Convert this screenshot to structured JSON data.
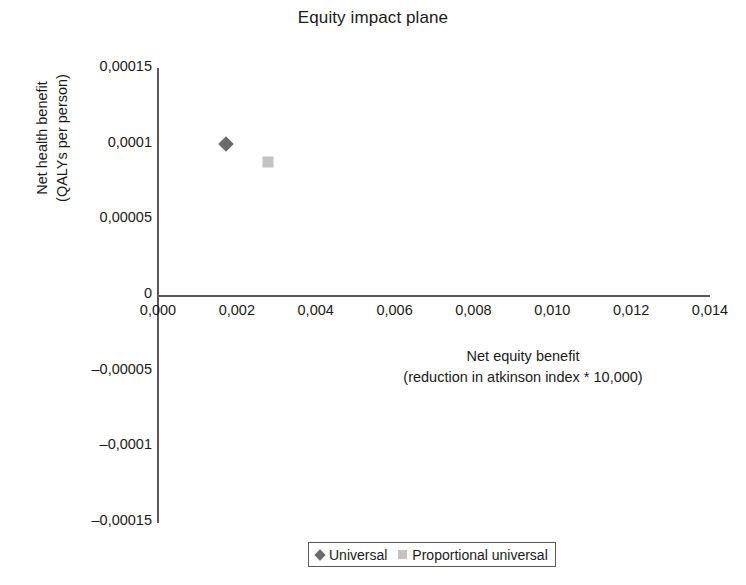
{
  "chart_data": {
    "type": "scatter",
    "title": "Equity impact plane",
    "xlabel": "Net equity benefit\n(reduction in atkinson index * 10,000)",
    "xlabel_line1": "Net equity benefit",
    "xlabel_line2": "(reduction in atkinson index * 10,000)",
    "ylabel": "Net health benefit\n(QALYs per person)",
    "ylabel_line1": "Net health benefit",
    "ylabel_line2": "(QALYs per person)",
    "xlim": [
      0.0,
      0.014
    ],
    "ylim": [
      -0.00015,
      0.00015
    ],
    "grid": false,
    "legend_position": "bottom",
    "x_ticks": [
      {
        "value": 0.0,
        "label": "0,000"
      },
      {
        "value": 0.002,
        "label": "0,002"
      },
      {
        "value": 0.004,
        "label": "0,004"
      },
      {
        "value": 0.006,
        "label": "0,006"
      },
      {
        "value": 0.008,
        "label": "0,008"
      },
      {
        "value": 0.01,
        "label": "0,010"
      },
      {
        "value": 0.012,
        "label": "0,012"
      },
      {
        "value": 0.014,
        "label": "0,014"
      }
    ],
    "y_ticks": [
      {
        "value": 0.00015,
        "label": "0,00015"
      },
      {
        "value": 0.0001,
        "label": "0,0001"
      },
      {
        "value": 5e-05,
        "label": "0,00005"
      },
      {
        "value": 0.0,
        "label": "0"
      },
      {
        "value": -5e-05,
        "label": "–0,00005"
      },
      {
        "value": -0.0001,
        "label": "–0,0001"
      },
      {
        "value": -0.00015,
        "label": "–0,00015"
      }
    ],
    "series": [
      {
        "name": "Universal",
        "marker": "diamond",
        "color": "#6b6b6b",
        "points": [
          {
            "x": 0.00173,
            "y": 0.0001
          }
        ]
      },
      {
        "name": "Proportional universal",
        "marker": "square",
        "color": "#c3c3c3",
        "points": [
          {
            "x": 0.00278,
            "y": 8.8e-05
          }
        ]
      }
    ]
  },
  "legend": {
    "items": [
      {
        "label": "Universal",
        "marker": "diamond",
        "color": "#6b6b6b"
      },
      {
        "label": "Proportional universal",
        "marker": "square",
        "color": "#c3c3c3"
      }
    ]
  },
  "colors": {
    "axis": "#5a5a5a",
    "text": "#1a1a1a",
    "background": "#ffffff",
    "series_universal": "#6b6b6b",
    "series_proportional_universal": "#c3c3c3"
  }
}
